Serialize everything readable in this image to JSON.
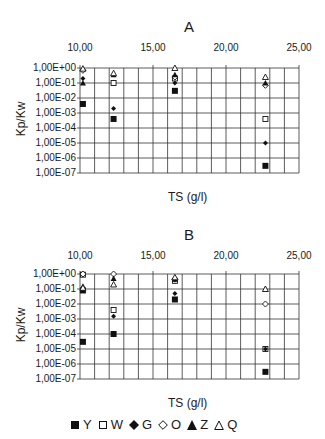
{
  "chart_data": [
    {
      "type": "scatter",
      "title": "A",
      "xlabel": "TS (g/l)",
      "ylabel": "Kp/Kw",
      "xlim": [
        10,
        25
      ],
      "x_ticks": [
        "10,00",
        "15,00",
        "20,00",
        "25,00"
      ],
      "yscale": "log",
      "ylim": [
        1e-07,
        1
      ],
      "y_ticks": [
        "1,00E+00",
        "1,00E-01",
        "1,00E-02",
        "1,00E-03",
        "1,00E-04",
        "1,00E-05",
        "1,00E-06",
        "1,00E-07"
      ],
      "grid": true,
      "x_axis_position": "top",
      "series": [
        {
          "name": "Y",
          "marker": "filled-square",
          "points": [
            [
              10.2,
              0.004
            ],
            [
              12.3,
              0.0004
            ],
            [
              16.5,
              0.03
            ],
            [
              22.7,
              3e-07
            ]
          ]
        },
        {
          "name": "W",
          "marker": "open-square",
          "points": [
            [
              12.3,
              0.1
            ],
            [
              16.5,
              0.2
            ],
            [
              22.7,
              0.0004
            ]
          ]
        },
        {
          "name": "G",
          "marker": "filled-diamond",
          "points": [
            [
              10.2,
              0.2
            ],
            [
              12.3,
              0.002
            ],
            [
              16.5,
              0.1
            ],
            [
              22.7,
              1e-05
            ]
          ]
        },
        {
          "name": "O",
          "marker": "open-diamond",
          "points": [
            [
              10.2,
              0.7
            ],
            [
              16.5,
              0.25
            ],
            [
              22.7,
              0.07
            ]
          ]
        },
        {
          "name": "Z",
          "marker": "filled-triangle",
          "points": [
            [
              10.2,
              0.1
            ],
            [
              12.3,
              0.35
            ],
            [
              16.5,
              0.35
            ],
            [
              22.7,
              0.1
            ]
          ]
        },
        {
          "name": "Q",
          "marker": "open-triangle",
          "points": [
            [
              10.2,
              0.9
            ],
            [
              12.3,
              0.45
            ],
            [
              16.5,
              1.0
            ],
            [
              22.7,
              0.25
            ]
          ]
        }
      ]
    },
    {
      "type": "scatter",
      "title": "B",
      "xlabel": "TS (g/l)",
      "ylabel": "Kp/Kw",
      "xlim": [
        10,
        25
      ],
      "x_ticks": [
        "10,00",
        "15,00",
        "20,00",
        "25,00"
      ],
      "yscale": "log",
      "ylim": [
        1e-07,
        1
      ],
      "y_ticks": [
        "1,00E+00",
        "1,00E-01",
        "1,00E-02",
        "1,00E-03",
        "1,00E-04",
        "1,00E-05",
        "1,00E-06",
        "1,00E-07"
      ],
      "grid": true,
      "x_axis_position": "top",
      "series": [
        {
          "name": "Y",
          "marker": "filled-square",
          "points": [
            [
              10.2,
              0.08
            ],
            [
              12.3,
              0.0001
            ],
            [
              16.5,
              0.02
            ],
            [
              22.7,
              3e-07
            ],
            [
              10.2,
              3e-05
            ]
          ]
        },
        {
          "name": "W",
          "marker": "open-square",
          "points": [
            [
              10.2,
              0.9
            ],
            [
              12.3,
              0.004
            ],
            [
              16.5,
              0.35
            ],
            [
              22.7,
              1e-05
            ]
          ]
        },
        {
          "name": "G",
          "marker": "filled-diamond",
          "points": [
            [
              10.2,
              0.1
            ],
            [
              12.3,
              0.0015
            ],
            [
              16.5,
              0.05
            ],
            [
              22.7,
              1e-05
            ]
          ]
        },
        {
          "name": "O",
          "marker": "open-diamond",
          "points": [
            [
              10.2,
              1.0
            ],
            [
              12.3,
              1.0
            ],
            [
              16.5,
              0.45
            ],
            [
              22.7,
              0.01
            ]
          ]
        },
        {
          "name": "Z",
          "marker": "filled-triangle",
          "points": [
            [
              10.2,
              0.15
            ],
            [
              12.3,
              0.5
            ],
            [
              16.5,
              0.45
            ],
            [
              22.7,
              0.1
            ]
          ]
        },
        {
          "name": "Q",
          "marker": "open-triangle",
          "points": [
            [
              10.2,
              0.12
            ],
            [
              12.3,
              0.2
            ],
            [
              16.5,
              0.6
            ],
            [
              22.7,
              0.1
            ]
          ]
        }
      ]
    }
  ],
  "charts": {
    "a": {
      "title": "A",
      "xlabel": "TS (g/l)",
      "ylabel": "Kp/Kw"
    },
    "b": {
      "title": "B",
      "xlabel": "TS (g/l)",
      "ylabel": "Kp/Kw"
    }
  },
  "x_ticks": [
    "10,00",
    "15,00",
    "20,00",
    "25,00"
  ],
  "y_ticks": [
    "1,00E+00",
    "1,00E-01",
    "1,00E-02",
    "1,00E-03",
    "1,00E-04",
    "1,00E-05",
    "1,00E-06",
    "1,00E-07"
  ],
  "legend": [
    {
      "marker": "filled-square",
      "label": "Y"
    },
    {
      "marker": "open-square",
      "label": "W"
    },
    {
      "marker": "filled-diamond",
      "label": "G"
    },
    {
      "marker": "open-diamond",
      "label": "O"
    },
    {
      "marker": "filled-triangle",
      "label": "Z"
    },
    {
      "marker": "open-triangle",
      "label": "Q"
    }
  ],
  "colors": {
    "grid": "#333333",
    "marker": "#111111",
    "background": "#ffffff"
  }
}
